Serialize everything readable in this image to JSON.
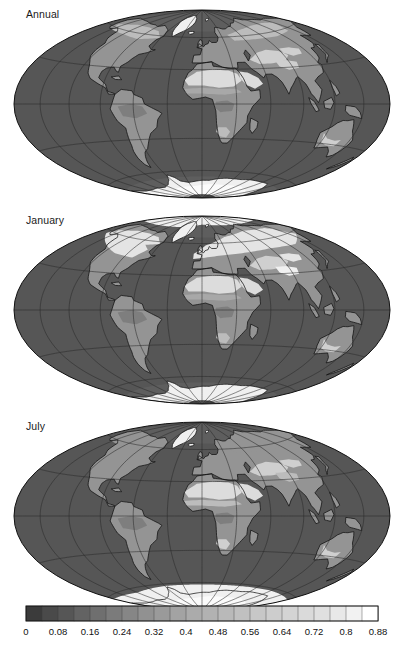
{
  "figure": {
    "type": "map-series",
    "projection": "hammer",
    "quantity": "surface albedo",
    "panel_count": 3,
    "background": "#ffffff"
  },
  "panels": [
    {
      "label": "Annual",
      "key": "annual"
    },
    {
      "label": "January",
      "key": "january"
    },
    {
      "label": "July",
      "key": "july"
    }
  ],
  "graticule": {
    "meridian_step_deg": 30,
    "parallel_step_deg": 30,
    "line_color": "#2b2b2b",
    "line_width": 0.55,
    "outline_color": "#111111",
    "outline_width": 1.0
  },
  "coastline": {
    "color": "#111111",
    "width": 0.75
  },
  "chart_data": {
    "type": "heatmap",
    "title": "",
    "xlabel": "",
    "ylabel": "",
    "colorbar": {
      "orientation": "horizontal",
      "vmin": 0,
      "vmax": 0.88,
      "step": 0.08,
      "n_bins": 22,
      "bin_width": 0.04,
      "tick_labels": [
        "0",
        "0.08",
        "0.16",
        "0.24",
        "0.32",
        "0.4",
        "0.48",
        "0.56",
        "0.64",
        "0.72",
        "0.8",
        "0.88"
      ],
      "tick_values": [
        0,
        0.08,
        0.16,
        0.24,
        0.32,
        0.4,
        0.48,
        0.56,
        0.64,
        0.72,
        0.8,
        0.88
      ],
      "border_color": "#111111",
      "colors": [
        "#3b3b3b",
        "#4a4a4a",
        "#565656",
        "#636363",
        "#6f6f6f",
        "#7b7b7b",
        "#868686",
        "#919191",
        "#9a9a9a",
        "#a3a3a3",
        "#ababab",
        "#b2b2b2",
        "#b9b9b9",
        "#c0c0c0",
        "#c7c7c7",
        "#cdcdcd",
        "#d4d4d4",
        "#dadada",
        "#e0e0e0",
        "#e8e8e8",
        "#f2f2f2",
        "#ffffff"
      ]
    },
    "fills": {
      "ocean": {
        "albedo": 0.07,
        "color": "#565656"
      },
      "ocean_polar": {
        "albedo": 0.12,
        "color": "#5e5e5e"
      },
      "seaice_edge": {
        "albedo": 0.3,
        "color": "#949494"
      },
      "land_dark": {
        "albedo": 0.14,
        "color": "#6e6e6e"
      },
      "land_forest": {
        "albedo": 0.16,
        "color": "#7e7e7e"
      },
      "land_mid": {
        "albedo": 0.2,
        "color": "#949494"
      },
      "land_light": {
        "albedo": 0.24,
        "color": "#a8a8a8"
      },
      "land_bright": {
        "albedo": 0.3,
        "color": "#bcbcbc"
      },
      "desert": {
        "albedo": 0.35,
        "color": "#cfcfcf"
      },
      "desert_hot": {
        "albedo": 0.4,
        "color": "#dcdcdc"
      },
      "snow": {
        "albedo": 0.56,
        "color": "#e4e4e4"
      },
      "ice_sheet": {
        "albedo": 0.72,
        "color": "#f0f0f0"
      },
      "ice_bright": {
        "albedo": 0.86,
        "color": "#fbfbfb"
      }
    },
    "regions": {
      "annual": [
        {
          "name": "antarctica-interior",
          "fill": "ice_bright"
        },
        {
          "name": "greenland-ice",
          "fill": "ice_sheet"
        },
        {
          "name": "sahara",
          "fill": "desert_hot"
        },
        {
          "name": "arabia",
          "fill": "desert_hot"
        },
        {
          "name": "central-asia",
          "fill": "desert"
        },
        {
          "name": "australia-interior",
          "fill": "desert"
        },
        {
          "name": "boreal-north",
          "fill": "land_bright"
        },
        {
          "name": "amazon",
          "fill": "land_forest"
        },
        {
          "name": "congo",
          "fill": "land_forest"
        }
      ],
      "january": [
        {
          "name": "eurasia-snow",
          "fill": "snow"
        },
        {
          "name": "north-america-snow",
          "fill": "snow"
        },
        {
          "name": "arctic-seaice",
          "fill": "ice_sheet"
        },
        {
          "name": "antarctica-interior",
          "fill": "ice_sheet"
        },
        {
          "name": "sahara",
          "fill": "desert_hot"
        }
      ],
      "july": [
        {
          "name": "antarctica-interior",
          "fill": "ice_bright"
        },
        {
          "name": "antarctic-seaice",
          "fill": "ice_sheet"
        },
        {
          "name": "arctic-open-ocean",
          "fill": "ocean_polar"
        },
        {
          "name": "sahara",
          "fill": "desert_hot"
        },
        {
          "name": "greenland-ice",
          "fill": "ice_sheet"
        }
      ]
    }
  }
}
